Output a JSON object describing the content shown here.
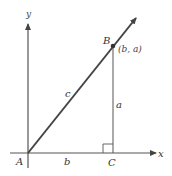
{
  "diagram": {
    "type": "right-triangle-on-axes",
    "axes": {
      "x_label": "x",
      "y_label": "y"
    },
    "points": {
      "A": {
        "label": "A"
      },
      "B": {
        "label": "B",
        "coord_label": "(b, a)"
      },
      "C": {
        "label": "C"
      }
    },
    "sides": {
      "hypotenuse": "c",
      "vertical": "a",
      "horizontal": "b"
    },
    "colors": {
      "line": "#444444",
      "axis": "#555555",
      "label": "#333333"
    }
  }
}
